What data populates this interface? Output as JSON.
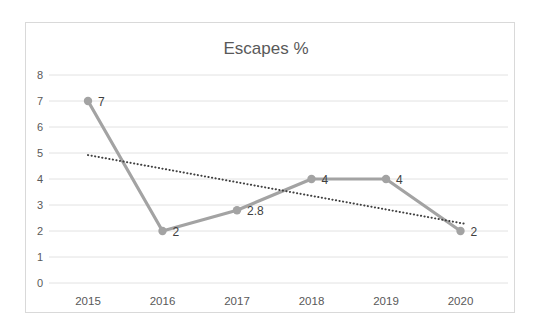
{
  "chart_data": {
    "type": "line",
    "title": "Escapes %",
    "categories": [
      "2015",
      "2016",
      "2017",
      "2018",
      "2019",
      "2020"
    ],
    "series": [
      {
        "name": "Escapes %",
        "values": [
          7,
          2,
          2.8,
          4,
          4,
          2
        ],
        "data_labels": [
          "7",
          "2",
          "2.8",
          "4",
          "4",
          "2"
        ],
        "color": "#a3a3a3",
        "marker": "circle"
      }
    ],
    "trendline": {
      "type": "linear",
      "style": "dotted",
      "color": "#404040",
      "start_index": 0,
      "start_value": 4.92,
      "end_index": 5.07,
      "end_value": 2.27
    },
    "ylim": [
      0,
      8
    ],
    "yticks": [
      0,
      1,
      2,
      3,
      4,
      5,
      6,
      7,
      8
    ],
    "grid": true,
    "legend": "none",
    "colors": {
      "gridline": "#e2e2e2",
      "axis_text": "#595959",
      "title": "#595959",
      "data_label": "#3f3f3f",
      "frame_border": "#d9d9d9",
      "background": "#ffffff"
    }
  }
}
